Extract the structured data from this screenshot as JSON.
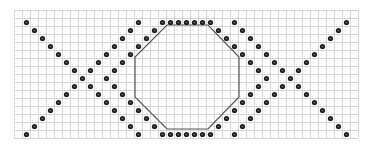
{
  "colors": {
    "background": "#ffffff",
    "grid_line": "#d4d4d4",
    "dot": "#1a1a1a",
    "dot_highlight": "#6a6a6a",
    "outline": "#555555"
  },
  "grid": {
    "origin_x": 14,
    "origin_y": 10,
    "cell": 8,
    "cols": 43,
    "rows": 16
  },
  "pattern": {
    "mirror_axis_col": 21,
    "left_half_dots": {
      "x_line_a": [
        [
          1,
          1
        ],
        [
          2,
          2
        ],
        [
          3,
          3
        ],
        [
          4,
          4
        ],
        [
          5,
          5
        ],
        [
          6,
          6
        ],
        [
          7,
          7
        ],
        [
          8,
          8
        ],
        [
          9,
          9
        ],
        [
          10,
          10
        ],
        [
          11,
          11
        ],
        [
          12,
          12
        ],
        [
          13,
          13
        ],
        [
          14,
          14
        ],
        [
          15,
          15
        ]
      ],
      "x_line_b": [
        [
          1,
          15
        ],
        [
          2,
          14
        ],
        [
          3,
          13
        ],
        [
          4,
          12
        ],
        [
          5,
          11
        ],
        [
          6,
          10
        ],
        [
          7,
          9
        ],
        [
          9,
          7
        ],
        [
          10,
          6
        ],
        [
          11,
          5
        ],
        [
          12,
          4
        ],
        [
          13,
          3
        ],
        [
          14,
          2
        ],
        [
          15,
          1
        ]
      ],
      "chevron_upper": [
        [
          18,
          1
        ],
        [
          17,
          2
        ],
        [
          16,
          3
        ],
        [
          15,
          4
        ],
        [
          14,
          5
        ],
        [
          13,
          6
        ],
        [
          12,
          7
        ],
        [
          11,
          8
        ]
      ],
      "chevron_lower": [
        [
          12,
          9
        ],
        [
          13,
          10
        ],
        [
          14,
          11
        ],
        [
          15,
          12
        ],
        [
          16,
          13
        ],
        [
          17,
          14
        ],
        [
          18,
          15
        ]
      ]
    },
    "center_dots": {
      "top_row": [
        [
          19,
          1
        ],
        [
          20,
          1
        ],
        [
          21,
          1
        ],
        [
          22,
          1
        ],
        [
          23,
          1
        ]
      ],
      "bottom_row": [
        [
          19,
          15
        ],
        [
          20,
          15
        ],
        [
          21,
          15
        ],
        [
          22,
          15
        ],
        [
          23,
          15
        ]
      ]
    },
    "octagon": {
      "points": [
        [
          167,
          25
        ],
        [
          208,
          25
        ],
        [
          239,
          57
        ],
        [
          239,
          97
        ],
        [
          208,
          129
        ],
        [
          167,
          129
        ],
        [
          135,
          97
        ],
        [
          135,
          57
        ]
      ]
    }
  }
}
